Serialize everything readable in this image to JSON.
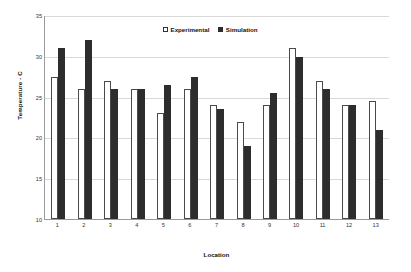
{
  "chart_data": {
    "type": "bar",
    "title": "",
    "xlabel": "Location",
    "ylabel": "Temperature - C",
    "categories": [
      "1",
      "2",
      "3",
      "4",
      "5",
      "6",
      "7",
      "8",
      "9",
      "10",
      "11",
      "12",
      "13"
    ],
    "series": [
      {
        "name": "Experimental",
        "color": "#ffffff",
        "values": [
          27.5,
          26,
          27,
          26,
          23,
          26,
          24,
          22,
          24,
          31,
          27,
          24,
          24.5
        ]
      },
      {
        "name": "Simulation",
        "color": "#2d2d2d",
        "values": [
          31,
          32,
          26,
          26,
          26.5,
          27.5,
          23.5,
          19,
          25.5,
          30,
          26,
          24,
          21
        ]
      }
    ],
    "ylim": [
      10,
      35
    ],
    "yticks": [
      "10",
      "15",
      "20",
      "25",
      "30",
      "35"
    ],
    "ytick_values": [
      10,
      15,
      20,
      25,
      30,
      35
    ],
    "grid": true,
    "legend_position": "top-center"
  },
  "legend": {
    "entries": [
      {
        "label": "Experimental",
        "marker": "open-square"
      },
      {
        "label": "Simulation",
        "marker": "filled-square"
      }
    ]
  }
}
